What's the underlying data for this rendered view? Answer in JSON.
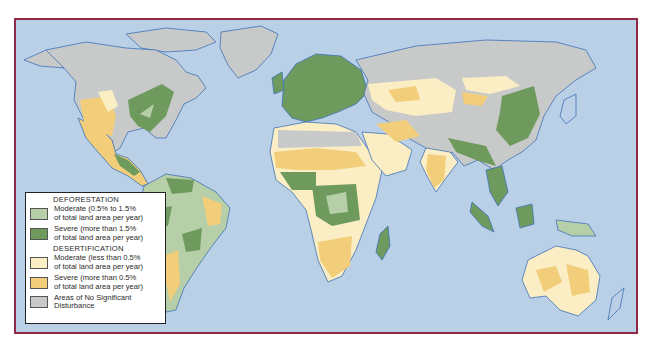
{
  "map": {
    "title": "World Deforestation and Desertification",
    "colors": {
      "frame_border": "#8e2a46",
      "ocean": "#b9d0e6",
      "coastline": "#3f72b8",
      "deforestation_moderate": "#b7cfa8",
      "deforestation_severe": "#6e9a5e",
      "desertification_moderate": "#fbeec4",
      "desertification_severe": "#f2cd7a",
      "no_significant_disturbance": "#c8c9c9"
    },
    "regions": [
      {
        "name": "North America",
        "categories": [
          "no_significant_disturbance",
          "deforestation_severe",
          "desertification_moderate",
          "desertification_severe"
        ]
      },
      {
        "name": "Central America",
        "categories": [
          "deforestation_severe"
        ]
      },
      {
        "name": "South America",
        "categories": [
          "deforestation_moderate",
          "deforestation_severe",
          "desertification_severe",
          "desertification_moderate"
        ]
      },
      {
        "name": "Europe",
        "categories": [
          "deforestation_severe"
        ]
      },
      {
        "name": "Africa",
        "categories": [
          "desertification_moderate",
          "desertification_severe",
          "deforestation_severe",
          "deforestation_moderate",
          "no_significant_disturbance"
        ]
      },
      {
        "name": "Asia",
        "categories": [
          "desertification_moderate",
          "desertification_severe",
          "deforestation_severe",
          "no_significant_disturbance"
        ]
      },
      {
        "name": "Australia",
        "categories": [
          "desertification_moderate",
          "desertification_severe"
        ]
      },
      {
        "name": "Greenland",
        "categories": [
          "no_significant_disturbance"
        ]
      }
    ]
  },
  "legend": {
    "deforestation": {
      "heading": "DEFORESTATION",
      "moderate_line1": "Moderate (0.5% to 1.5%",
      "moderate_line2": "of total land area per year)",
      "severe_line1": "Severe (more than 1.5%",
      "severe_line2": "of total land area per year)"
    },
    "desertification": {
      "heading": "DESERTIFICATION",
      "moderate_line1": "Moderate (less than 0.5%",
      "moderate_line2": "of total land area per year)",
      "severe_line1": "Severe (more than 0.5%",
      "severe_line2": "of total land area per year)"
    },
    "none": {
      "line1": "Areas of No Significant",
      "line2": "Disturbance"
    }
  }
}
